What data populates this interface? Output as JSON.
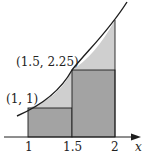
{
  "diagram": {
    "axis": {
      "label": "x",
      "ticks": [
        "1",
        "1.5",
        "2"
      ]
    },
    "points": [
      {
        "label": "(1, 1)",
        "x": 1,
        "y": 1
      },
      {
        "label": "(1.5, 2.25)",
        "x": 1.5,
        "y": 2.25
      }
    ],
    "rectangles": [
      {
        "x_from": 1,
        "x_to": 1.5,
        "height": 1
      },
      {
        "x_from": 1.5,
        "x_to": 2,
        "height": 2.25
      }
    ],
    "colors": {
      "under_curve_fill": "#cfcfcf",
      "rectangle_fill": "#a3a3a3",
      "stroke": "#1e1e1e"
    }
  }
}
